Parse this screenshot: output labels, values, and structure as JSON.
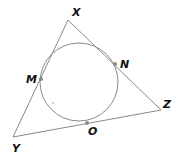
{
  "diagram": {
    "type": "incircle-triangle",
    "colors": {
      "stroke": "#8a8a8a",
      "point": "#8a8a8a",
      "label": "#111111"
    },
    "triangle": {
      "vertices": [
        {
          "name": "X",
          "x": 68,
          "y": 20,
          "label": "X",
          "lx": 72,
          "ly": 16
        },
        {
          "name": "Y",
          "x": 13,
          "y": 137,
          "label": "Y",
          "lx": 12,
          "ly": 152
        },
        {
          "name": "Z",
          "x": 161,
          "y": 110,
          "label": "Z",
          "lx": 163,
          "ly": 108
        }
      ]
    },
    "circle": {
      "cx": 79,
      "cy": 82,
      "r": 39
    },
    "tangent_points": [
      {
        "name": "M",
        "x": 41,
        "y": 79,
        "label": "M",
        "lx": 26,
        "ly": 83
      },
      {
        "name": "N",
        "x": 115,
        "y": 64,
        "label": "N",
        "lx": 120,
        "ly": 68
      },
      {
        "name": "O",
        "x": 87,
        "y": 123,
        "label": "O",
        "lx": 88,
        "ly": 135
      }
    ]
  }
}
